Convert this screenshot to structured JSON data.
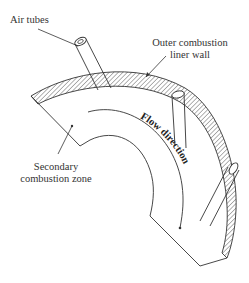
{
  "diagram": {
    "labels": {
      "air_tubes": "Air tubes",
      "outer_liner_line1": "Outer combustion",
      "outer_liner_line2": "liner wall",
      "secondary_line1": "Secondary",
      "secondary_line2": "combustion zone",
      "flow_direction": "Flow direction"
    },
    "colors": {
      "stroke": "#333333",
      "hatch": "#555555",
      "background": "#ffffff"
    },
    "components": [
      "outer combustion liner wall (hatched curved band)",
      "three air tubes penetrating the liner wall",
      "secondary combustion zone (curved duct interior)",
      "flow direction arrow along the curve"
    ]
  }
}
